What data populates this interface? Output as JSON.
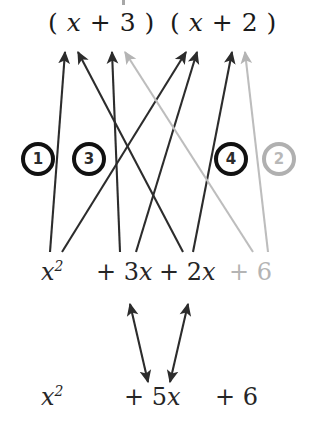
{
  "diagram": {
    "colors": {
      "dark": "#262626",
      "mid_dark": "#3a3a3a",
      "faded": "#b4b4b4",
      "background": "#ffffff"
    },
    "factors": [
      {
        "id": "factor-left",
        "text": "( x + 3 )",
        "state": "normal"
      },
      {
        "id": "factor-right",
        "text": "( x + 2 )",
        "state": "normal"
      }
    ],
    "factor_parts": {
      "left": {
        "open": "(",
        "var": "x",
        "plus": "+",
        "num": "3",
        "close": ")"
      },
      "right": {
        "open": "(",
        "var": "x",
        "plus": "+",
        "num": "2",
        "close": ")"
      }
    },
    "badges": [
      {
        "id": "badge-1",
        "label": "1",
        "state": "normal"
      },
      {
        "id": "badge-3",
        "label": "3",
        "state": "normal"
      },
      {
        "id": "badge-4",
        "label": "4",
        "state": "normal"
      },
      {
        "id": "badge-2",
        "label": "2",
        "state": "faded"
      }
    ],
    "expanded_terms": [
      {
        "id": "term-x2",
        "prefix": "",
        "coef": "",
        "var": "x",
        "exp": "2",
        "state": "normal"
      },
      {
        "id": "term-3x",
        "prefix": "+",
        "coef": "3",
        "var": "x",
        "exp": "",
        "state": "normal"
      },
      {
        "id": "term-2x",
        "prefix": "+",
        "coef": "2",
        "var": "x",
        "exp": "",
        "state": "normal"
      },
      {
        "id": "term-6",
        "prefix": "+",
        "coef": "6",
        "var": "",
        "exp": "",
        "state": "faded"
      }
    ],
    "result_terms": [
      {
        "id": "result-x2",
        "prefix": "",
        "coef": "",
        "var": "x",
        "exp": "2",
        "state": "normal"
      },
      {
        "id": "result-5x",
        "prefix": "+",
        "coef": "5",
        "var": "x",
        "exp": "",
        "state": "normal"
      },
      {
        "id": "result-6",
        "prefix": "+",
        "coef": "6",
        "var": "",
        "exp": "",
        "state": "normal"
      }
    ],
    "labels": {
      "expanded_x2": "x2",
      "expanded_3x": "+ 3x",
      "expanded_2x": "+ 2x",
      "expanded_6": "+ 6",
      "result_x2": "x2",
      "result_5x": "+ 5x",
      "result_6": "+ 6"
    },
    "connections": [
      {
        "id": "conn-1a",
        "from": "term-x2",
        "to": "factor-left-x",
        "state": "normal"
      },
      {
        "id": "conn-1b",
        "from": "term-x2",
        "to": "factor-right-x",
        "state": "normal"
      },
      {
        "id": "conn-3a",
        "from": "term-3x",
        "to": "factor-left-3",
        "state": "normal"
      },
      {
        "id": "conn-3b",
        "from": "term-3x",
        "to": "factor-right-x",
        "state": "normal"
      },
      {
        "id": "conn-4a",
        "from": "term-2x",
        "to": "factor-left-x",
        "state": "normal"
      },
      {
        "id": "conn-4b",
        "from": "term-2x",
        "to": "factor-right-2",
        "state": "normal"
      },
      {
        "id": "conn-2a",
        "from": "term-6",
        "to": "factor-left-3",
        "state": "faded"
      },
      {
        "id": "conn-2b",
        "from": "term-6",
        "to": "factor-right-2",
        "state": "faded"
      },
      {
        "id": "conn-sum-a",
        "from": "term-3x",
        "to": "result-5x",
        "state": "normal",
        "double": true
      },
      {
        "id": "conn-sum-b",
        "from": "term-2x",
        "to": "result-5x",
        "state": "normal",
        "double": true
      }
    ]
  }
}
